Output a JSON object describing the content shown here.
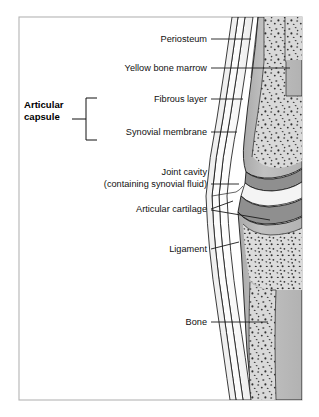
{
  "figure": {
    "kind": "anatomical-diagram",
    "frame": {
      "border_color": "#b4b4b4",
      "background": "#ffffff"
    },
    "palette": {
      "page_background": "#ffffff",
      "frame_border": "#b4b4b4",
      "bone_cortex": "#b9b9b9",
      "marrow_fill": "#d8d8d8",
      "marrow_speckle": "#3a3a3a",
      "cartilage": "#8f8f8f",
      "joint_cavity": "#f2f2f2",
      "capsule_fill": "#fafafa",
      "synovial_membrane": "#c9c9c9",
      "outline": "#1a1a1a",
      "label_text": "#111111",
      "leader_line": "#1b1b1b"
    },
    "labels": [
      {
        "id": "periosteum",
        "text": "Periosteum",
        "bold": false,
        "text_anchor": "end",
        "text_x": 207,
        "text_y": 42,
        "leader": "M 211 39 L 251 39"
      },
      {
        "id": "yellow-bone-marrow",
        "text": "Yellow bone marrow",
        "bold": false,
        "text_anchor": "end",
        "text_x": 207,
        "text_y": 71,
        "leader": "M 211 68 L 290 68"
      },
      {
        "id": "articular-capsule",
        "text_lines": [
          "Articular",
          "capsule"
        ],
        "bold": true,
        "text_anchor": "start",
        "text_x": 24,
        "text_y": 108,
        "line_height": 12,
        "leader": "M 72 119 L 84 119",
        "bracket": "M 97 98 L 86 98 L 86 140 L 97 140"
      },
      {
        "id": "fibrous-layer",
        "text": "Fibrous layer",
        "bold": false,
        "text_anchor": "end",
        "text_x": 207,
        "text_y": 102,
        "leader": "M 211 99 L 243 99"
      },
      {
        "id": "synovial-membrane",
        "text": "Synovial membrane",
        "bold": false,
        "text_anchor": "end",
        "text_x": 207,
        "text_y": 135,
        "leader": "M 211 132 L 237 132"
      },
      {
        "id": "joint-cavity",
        "text_lines": [
          "Joint cavity",
          "(containing synovial fluid)"
        ],
        "bold": false,
        "text_anchor": "end",
        "text_x": 207,
        "text_y": 175,
        "line_height": 12,
        "leader": "M 211 184 L 239 184"
      },
      {
        "id": "articular-cartilage",
        "text": "Articular cartilage",
        "bold": false,
        "text_anchor": "end",
        "text_x": 207,
        "text_y": 212,
        "leader": "M 211 209 L 232 202",
        "leader2": "M 211 210 L 268 219"
      },
      {
        "id": "ligament",
        "text": "Ligament",
        "bold": false,
        "text_anchor": "end",
        "text_x": 207,
        "text_y": 252,
        "leader": "M 211 249 L 238 243"
      },
      {
        "id": "bone",
        "text": "Bone",
        "bold": false,
        "text_anchor": "end",
        "text_x": 207,
        "text_y": 325,
        "leader": "M 211 322 L 268 322"
      }
    ]
  }
}
